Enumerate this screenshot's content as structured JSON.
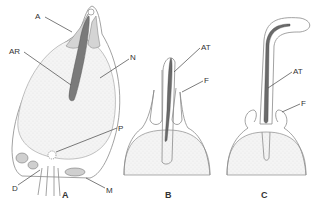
{
  "figure": {
    "colors": {
      "outline": "#8a8a8a",
      "nucleus_fill": "#eeeeee",
      "acrosome_fill": "#d4d4d4",
      "filament_fill": "#6a6a6a",
      "text": "#333333"
    },
    "panels": [
      {
        "id": "A",
        "label": "A",
        "callouts": [
          {
            "text": "A",
            "meaning": "acrosome"
          },
          {
            "text": "AR",
            "meaning": "axial rod"
          },
          {
            "text": "N",
            "meaning": "nucleus"
          },
          {
            "text": "P",
            "meaning": "centriole"
          },
          {
            "text": "D",
            "meaning": "distal centriole / flagellum base"
          },
          {
            "text": "M",
            "meaning": "mitochondrion"
          }
        ]
      },
      {
        "id": "B",
        "label": "B",
        "callouts": [
          {
            "text": "AT",
            "meaning": "acrosomal tubule"
          },
          {
            "text": "F",
            "meaning": "fold"
          }
        ]
      },
      {
        "id": "C",
        "label": "C",
        "callouts": [
          {
            "text": "AT",
            "meaning": "acrosomal tubule"
          },
          {
            "text": "F",
            "meaning": "fold"
          }
        ]
      }
    ]
  }
}
